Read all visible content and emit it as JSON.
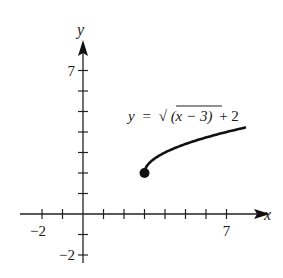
{
  "chart_data": {
    "type": "line",
    "title": "",
    "equation_label": {
      "lhs": "y",
      "eq": "=",
      "radical_content": "(x − 3)",
      "tail": "+ 2",
      "full": "y = √(x − 3) + 2"
    },
    "xlabel": "x",
    "ylabel": "y",
    "xlim": [
      -3,
      9
    ],
    "ylim": [
      -3,
      8
    ],
    "x_tick_labels": [
      {
        "value": -2,
        "label": "−2"
      },
      {
        "value": 7,
        "label": "7"
      }
    ],
    "y_tick_labels": [
      {
        "value": 7,
        "label": "7"
      },
      {
        "value": -2,
        "label": "−2"
      }
    ],
    "x_ticks": [
      -2,
      -1,
      1,
      2,
      3,
      4,
      5,
      6,
      7
    ],
    "y_ticks": [
      -2,
      -1,
      1,
      2,
      3,
      4,
      5,
      6,
      7
    ],
    "grid": false,
    "series": [
      {
        "name": "y = sqrt(x-3) + 2",
        "function": "sqrt(x-3)+2",
        "x_start": 3,
        "x_end": 7.9,
        "start_point": {
          "x": 3,
          "y": 2,
          "marker": "filled-circle"
        },
        "color": "#111111"
      }
    ]
  }
}
